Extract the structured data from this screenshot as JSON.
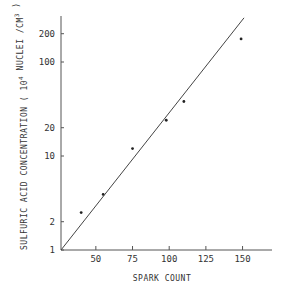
{
  "chart_data": {
    "type": "scatter",
    "title": "",
    "xlabel": "SPARK COUNT",
    "ylabel": "SULFURIC ACID CONCENTRATION ( 10^4 NUCLEI /CM^3 )",
    "ylabel_parts": {
      "main": "SULFURIC ACID CONCENTRATION  ( 10",
      "exp1": "4",
      "mid": " NUCLEI /CM",
      "exp2": "3",
      "end": " )"
    },
    "x_scale": "linear",
    "y_scale": "log",
    "xlim": [
      26,
      168
    ],
    "ylim": [
      1,
      350
    ],
    "x_ticks": [
      50,
      75,
      100,
      125,
      150
    ],
    "x_tick_labels": [
      "50",
      "75",
      "100",
      "125",
      "150"
    ],
    "y_ticks": [
      1,
      2,
      10,
      20,
      100,
      200
    ],
    "y_tick_labels": [
      "1",
      "2",
      "10",
      "20",
      "100",
      "200"
    ],
    "grid": false,
    "legend": null,
    "series": [
      {
        "name": "measurements",
        "kind": "points",
        "x": [
          40,
          55,
          75,
          98,
          110,
          149
        ],
        "y": [
          2.5,
          3.9,
          12,
          24,
          38,
          176
        ]
      },
      {
        "name": "fit",
        "kind": "line",
        "x": [
          26,
          151
        ],
        "y": [
          1,
          295
        ]
      }
    ]
  }
}
